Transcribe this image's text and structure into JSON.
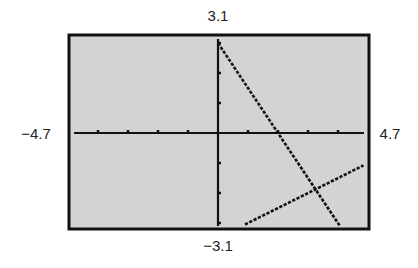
{
  "chart_data": {
    "type": "line",
    "title": "",
    "xlabel": "",
    "ylabel": "",
    "window": {
      "xmin": -4.7,
      "xmax": 4.7,
      "ymin": -3.1,
      "ymax": 3.1,
      "xscl": 1,
      "yscl": 1
    },
    "window_labels": {
      "ymax": "3.1",
      "ymin": "−3.1",
      "xmin": "−4.7",
      "xmax": "4.7"
    },
    "grid": false,
    "legend": null,
    "series": [
      {
        "name": "line-1",
        "equation": "y = 3 - 1.5x",
        "x": [
          0,
          4.05
        ],
        "y": [
          3,
          -3.08
        ]
      },
      {
        "name": "line-2",
        "equation": "y = 0.5x - 3.5",
        "x": [
          0.9,
          4.85
        ],
        "y": [
          -3.05,
          -1.08
        ]
      }
    ],
    "intersection": {
      "x": 3.25,
      "y": -1.875
    }
  },
  "colors": {
    "screen": "#d3d3d3",
    "ink": "#111111",
    "frame": "#111111"
  }
}
